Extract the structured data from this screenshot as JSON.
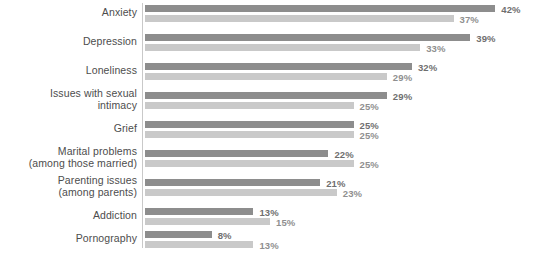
{
  "chart_data": {
    "type": "bar",
    "orientation": "horizontal",
    "title": "",
    "subtitle": "",
    "xlabel": "",
    "ylabel": "",
    "grid": false,
    "legend_position": "none",
    "xlim": [
      0,
      45
    ],
    "value_suffix": "%",
    "px_per_unit": 8.34,
    "colors": {
      "series1": "#8d8d8d",
      "series2": "#c9c9c9",
      "axis": "#c9c9c9",
      "label_text": "#4d4d4d",
      "value_text_primary": "#6f6f6f",
      "value_text_secondary": "#8f8f8f",
      "background": "#ffffff"
    },
    "categories": [
      "Anxiety",
      "Depression",
      "Loneliness",
      "Issues with sexual intimacy",
      "Grief",
      "Marital problems (among those married)",
      "Parenting issues (among parents)",
      "Addiction",
      "Pornography"
    ],
    "category_lines": [
      [
        "Anxiety"
      ],
      [
        "Depression"
      ],
      [
        "Loneliness"
      ],
      [
        "Issues with sexual",
        "intimacy"
      ],
      [
        "Grief"
      ],
      [
        "Marital problems",
        "(among those married)"
      ],
      [
        "Parenting issues",
        "(among parents)"
      ],
      [
        "Addiction"
      ],
      [
        "Pornography"
      ]
    ],
    "series": [
      {
        "name": "series1",
        "values": [
          42,
          39,
          32,
          29,
          25,
          22,
          21,
          13,
          8
        ],
        "labels": [
          "42%",
          "39%",
          "32%",
          "29%",
          "25%",
          "22%",
          "21%",
          "13%",
          "8%"
        ]
      },
      {
        "name": "series2",
        "values": [
          37,
          33,
          29,
          25,
          25,
          25,
          23,
          15,
          13
        ],
        "labels": [
          "37%",
          "33%",
          "29%",
          "25%",
          "25%",
          "25%",
          "23%",
          "15%",
          "13%"
        ]
      }
    ]
  }
}
